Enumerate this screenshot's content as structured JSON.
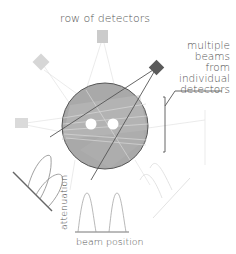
{
  "labels": {
    "title": "row of detectors",
    "right_annotation": [
      "multiple",
      "beams",
      "from",
      "individual",
      "detectors"
    ],
    "x_axis": "beam position",
    "y_axis": "attenuation"
  },
  "colors": {
    "circle_fill": "#a8a8a8",
    "circle_stroke": "#555555",
    "dark_detector": "#5a5a5a",
    "light_detector": "#cccccc",
    "text": "#555555",
    "curve": "#888888"
  },
  "elements": {
    "detectors": [
      "top-detector",
      "upper-left-detector",
      "left-detector",
      "dark-detector-upper-right"
    ],
    "holes": 2,
    "profiles": [
      "lower-left-profile",
      "bottom-profile",
      "lower-right-profile"
    ]
  }
}
